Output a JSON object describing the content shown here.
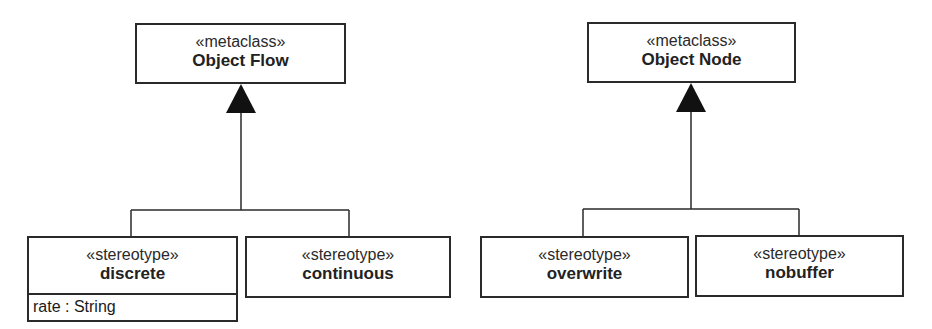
{
  "diagram": {
    "left_group": {
      "metaclass": {
        "stereotype": "«metaclass»",
        "name": "Object Flow"
      },
      "children": [
        {
          "stereotype": "«stereotype»",
          "name": "discrete",
          "attributes": [
            "rate : String"
          ]
        },
        {
          "stereotype": "«stereotype»",
          "name": "continuous"
        }
      ]
    },
    "right_group": {
      "metaclass": {
        "stereotype": "«metaclass»",
        "name": "Object Node"
      },
      "children": [
        {
          "stereotype": "«stereotype»",
          "name": "overwrite"
        },
        {
          "stereotype": "«stereotype»",
          "name": "nobuffer"
        }
      ]
    },
    "relationship": "generalization",
    "line_color": "#2a2a2a"
  }
}
